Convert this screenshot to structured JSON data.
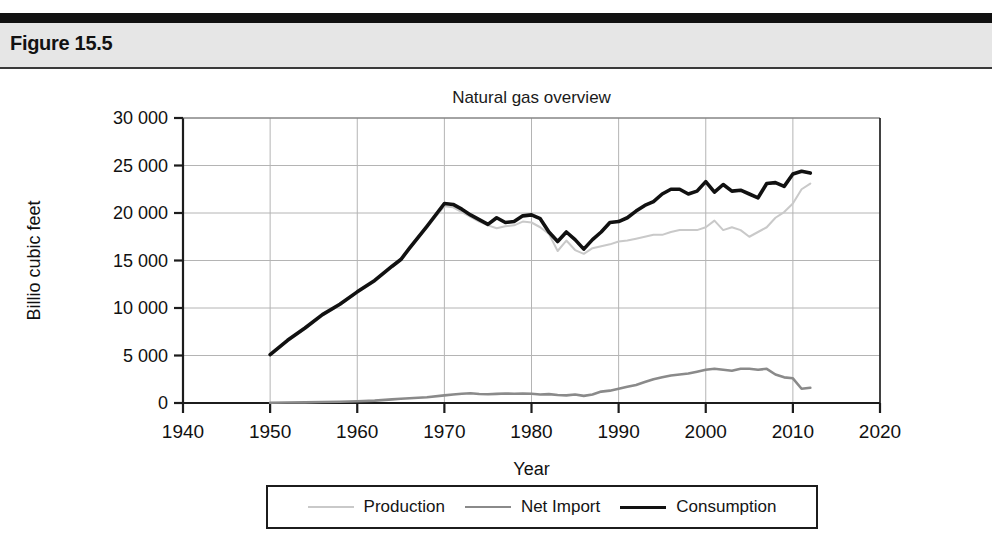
{
  "figure": {
    "label": "Figure 15.5"
  },
  "chart_data": {
    "type": "line",
    "title": "Natural gas overview",
    "xlabel": "Year",
    "ylabel": "Billio cubic feet",
    "xlim": [
      1940,
      2020
    ],
    "ylim": [
      0,
      30000
    ],
    "grid": true,
    "legend_position": "bottom",
    "xticks": [
      1940,
      1950,
      1960,
      1970,
      1980,
      1990,
      2000,
      2010,
      2020
    ],
    "xtick_labels": [
      "1940",
      "1950",
      "1960",
      "1970",
      "1980",
      "1990",
      "2000",
      "2010",
      "2020"
    ],
    "yticks": [
      0,
      5000,
      10000,
      15000,
      20000,
      25000,
      30000
    ],
    "ytick_labels": [
      "0",
      "5 000",
      "10 000",
      "15 000",
      "20 000",
      "25 000",
      "30 000"
    ],
    "x": [
      1950,
      1952,
      1954,
      1956,
      1958,
      1960,
      1962,
      1964,
      1965,
      1966,
      1968,
      1970,
      1971,
      1972,
      1973,
      1974,
      1975,
      1976,
      1977,
      1978,
      1979,
      1980,
      1981,
      1982,
      1983,
      1984,
      1985,
      1986,
      1987,
      1988,
      1989,
      1990,
      1991,
      1992,
      1993,
      1994,
      1995,
      1996,
      1997,
      1998,
      1999,
      2000,
      2001,
      2002,
      2003,
      2004,
      2005,
      2006,
      2007,
      2008,
      2009,
      2010,
      2011,
      2012
    ],
    "series": [
      {
        "name": "Production",
        "color": "#c9c9c9",
        "width": 2,
        "values": [
          5000,
          6500,
          7800,
          9200,
          10300,
          11600,
          12800,
          14300,
          15000,
          16200,
          18500,
          20700,
          20600,
          20100,
          19600,
          19100,
          18700,
          18400,
          18600,
          18700,
          19100,
          19000,
          18500,
          17800,
          16000,
          17100,
          16100,
          15700,
          16300,
          16500,
          16700,
          17000,
          17100,
          17300,
          17500,
          17700,
          17700,
          18000,
          18200,
          18200,
          18200,
          18500,
          19200,
          18200,
          18500,
          18200,
          17500,
          18000,
          18500,
          19500,
          20100,
          21000,
          22500,
          23100
        ]
      },
      {
        "name": "Net Import",
        "color": "#8a8a8a",
        "width": 2.6,
        "values": [
          20,
          50,
          70,
          100,
          130,
          180,
          250,
          380,
          450,
          500,
          600,
          800,
          900,
          980,
          1020,
          950,
          920,
          960,
          1000,
          970,
          1000,
          980,
          900,
          930,
          850,
          800,
          900,
          750,
          900,
          1200,
          1300,
          1500,
          1700,
          1900,
          2200,
          2500,
          2700,
          2900,
          3000,
          3100,
          3300,
          3500,
          3600,
          3500,
          3400,
          3600,
          3600,
          3500,
          3600,
          3000,
          2700,
          2600,
          1500,
          1600
        ]
      },
      {
        "name": "Consumption",
        "color": "#111111",
        "width": 3.6,
        "values": [
          5100,
          6600,
          7900,
          9300,
          10400,
          11700,
          12900,
          14400,
          15100,
          16300,
          18600,
          21000,
          20900,
          20400,
          19800,
          19300,
          18800,
          19500,
          19000,
          19100,
          19700,
          19800,
          19400,
          18000,
          17000,
          18000,
          17200,
          16200,
          17200,
          18000,
          19000,
          19100,
          19500,
          20200,
          20800,
          21200,
          22000,
          22500,
          22500,
          22000,
          22300,
          23300,
          22200,
          23000,
          22300,
          22400,
          22000,
          21600,
          23100,
          23200,
          22800,
          24100,
          24400,
          24200
        ]
      }
    ]
  }
}
